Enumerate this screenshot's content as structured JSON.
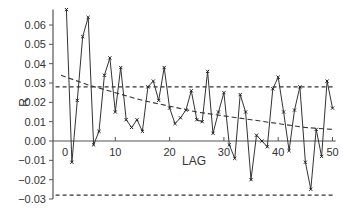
{
  "chart_data": {
    "type": "line",
    "title": "",
    "xlabel": "LAG",
    "ylabel": "R",
    "xlim": [
      0,
      50
    ],
    "ylim": [
      -0.03,
      0.068
    ],
    "grid": false,
    "legend": null,
    "x_ticks": [
      "0",
      "10",
      "20",
      "30",
      "40",
      "50"
    ],
    "y_ticks": [
      "0.06",
      "0.05",
      "0.04",
      "0.03",
      "0.02",
      "0.01",
      "0.00",
      "−0.01",
      "−0.02",
      "−0.03"
    ],
    "series": [
      {
        "name": "autocorrelation",
        "style": "solid line with x markers",
        "x": [
          1,
          2,
          3,
          4,
          5,
          6,
          7,
          8,
          9,
          10,
          11,
          12,
          13,
          14,
          15,
          16,
          17,
          18,
          19,
          20,
          21,
          22,
          23,
          24,
          25,
          26,
          27,
          28,
          29,
          30,
          31,
          32,
          33,
          34,
          35,
          36,
          37,
          38,
          39,
          40,
          41,
          42,
          43,
          44,
          45,
          46,
          47,
          48,
          49,
          50
        ],
        "values": [
          0.068,
          -0.011,
          0.021,
          0.054,
          0.064,
          -0.002,
          0.005,
          0.034,
          0.043,
          0.015,
          0.038,
          0.011,
          0.007,
          0.011,
          0.005,
          0.028,
          0.031,
          0.021,
          0.038,
          0.017,
          0.009,
          0.012,
          0.016,
          0.026,
          0.011,
          0.01,
          0.036,
          0.004,
          0.015,
          0.025,
          -0.002,
          -0.009,
          0.024,
          0.015,
          -0.02,
          0.003,
          0.0,
          -0.003,
          0.027,
          0.033,
          0.015,
          -0.005,
          0.016,
          0.028,
          -0.011,
          -0.025,
          0.006,
          -0.008,
          0.031,
          0.017
        ]
      },
      {
        "name": "decay curve",
        "style": "dashed",
        "x": [
          0,
          5,
          10,
          15,
          20,
          25,
          30,
          35,
          40,
          45,
          50
        ],
        "values": [
          0.034,
          0.029,
          0.025,
          0.021,
          0.018,
          0.015,
          0.013,
          0.011,
          0.009,
          0.007,
          0.006
        ]
      },
      {
        "name": "upper confidence bound",
        "style": "dashed",
        "x": [
          0,
          50
        ],
        "values": [
          0.028,
          0.028
        ]
      },
      {
        "name": "lower confidence bound",
        "style": "dashed",
        "x": [
          0,
          50
        ],
        "values": [
          -0.028,
          -0.028
        ]
      }
    ]
  }
}
